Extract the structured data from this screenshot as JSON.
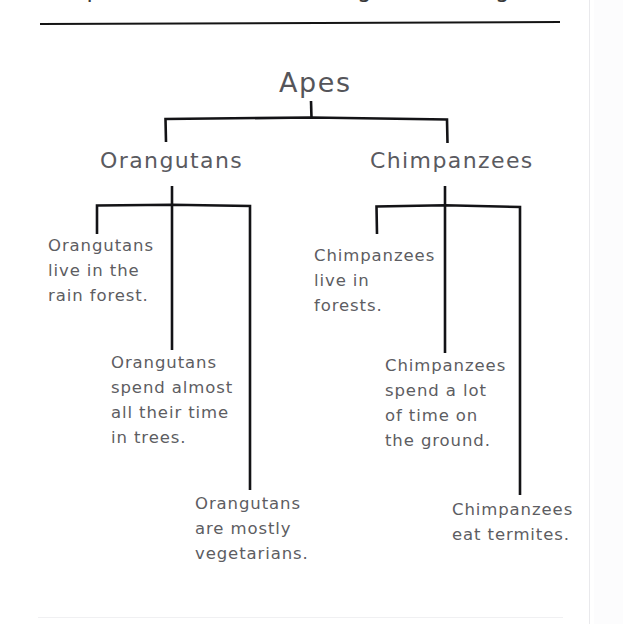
{
  "page": {
    "title_cut": "Compare and contrast using a tree diagram",
    "background": "#ffffff",
    "ink_color": "#131316",
    "text_color": "#5a5a5f"
  },
  "diagram": {
    "type": "tree",
    "root": {
      "label": "Apes"
    },
    "branches": [
      {
        "label": "Orangutans",
        "leaves": [
          "Orangutans\nlive in the\nrain forest.",
          "Orangutans\nspend almost\nall their time\nin trees.",
          "Orangutans\nare mostly\nvegetarians."
        ]
      },
      {
        "label": "Chimpanzees",
        "leaves": [
          "Chimpanzees\nlive in\nforests.",
          "Chimpanzees\nspend a lot\nof time on\nthe ground.",
          "Chimpanzees\neat termites."
        ]
      }
    ]
  }
}
